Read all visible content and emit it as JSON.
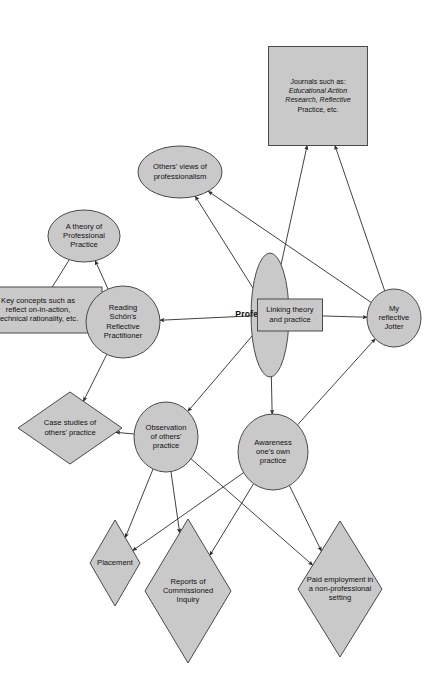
{
  "diagram": {
    "orientation": "rotated-90-clockwise",
    "colors": {
      "shape_fill": "#c9c9c9",
      "shape_stroke": "#4a4a4a",
      "edge": "#2b2b2b",
      "text": "#111111",
      "background": "#ffffff"
    },
    "nodes": [
      {
        "id": "key-concepts",
        "shape": "rectangle",
        "lines": [
          "Key concepts such as",
          "reflect on-in-action,",
          "technical rationality, etc."
        ],
        "style": "plain"
      },
      {
        "id": "theory-professional-practice",
        "shape": "ellipse",
        "lines": [
          "A theory of",
          "Professional",
          "Practice"
        ],
        "style": "plain"
      },
      {
        "id": "reading-schon",
        "shape": "ellipse",
        "lines": [
          "Reading",
          "Schön's",
          "Reflective",
          "Practitioner"
        ],
        "style": "plain"
      },
      {
        "id": "case-studies",
        "shape": "diamond",
        "lines": [
          "Case studies of",
          "others' practice"
        ],
        "style": "plain"
      },
      {
        "id": "others-views",
        "shape": "ellipse",
        "lines": [
          "Others' views of",
          "professionalism"
        ],
        "style": "plain"
      },
      {
        "id": "journals",
        "shape": "diamond",
        "lines": [
          "Journals such as:",
          "Educational Action",
          "Research, Reflective",
          "Practice, etc."
        ],
        "style": "italic-partial"
      },
      {
        "id": "professionalism",
        "shape": "ellipse",
        "lines": [
          "Professionalism"
        ],
        "style": "bold"
      },
      {
        "id": "linking-theory",
        "shape": "rectangle",
        "lines": [
          "Linking theory",
          "and practice"
        ],
        "style": "plain"
      },
      {
        "id": "my-reflective-jotter",
        "shape": "circle",
        "lines": [
          "My",
          "reflective",
          "Jotter"
        ],
        "style": "plain"
      },
      {
        "id": "observation-others",
        "shape": "circle",
        "lines": [
          "Observation",
          "of others'",
          "practice"
        ],
        "style": "plain"
      },
      {
        "id": "awareness-own",
        "shape": "circle",
        "lines": [
          "Awareness",
          "one's own",
          "practice"
        ],
        "style": "plain"
      },
      {
        "id": "placement",
        "shape": "diamond",
        "lines": [
          "Placement"
        ],
        "style": "plain"
      },
      {
        "id": "reports-inquiry",
        "shape": "diamond",
        "lines": [
          "Reports of",
          "Commissioned",
          "Inquiry"
        ],
        "style": "plain"
      },
      {
        "id": "paid-employment",
        "shape": "diamond",
        "lines": [
          "Paid employment in",
          "a non-professional",
          "setting"
        ],
        "style": "plain"
      }
    ],
    "edges": [
      {
        "from": "professionalism",
        "to": "reading-schon",
        "arrow": "to"
      },
      {
        "from": "professionalism",
        "to": "linking-theory",
        "arrow": "none"
      },
      {
        "from": "linking-theory",
        "to": "my-reflective-jotter",
        "arrow": "to"
      },
      {
        "from": "professionalism",
        "to": "others-views",
        "arrow": "to"
      },
      {
        "from": "professionalism",
        "to": "journals",
        "arrow": "to"
      },
      {
        "from": "professionalism",
        "to": "observation-others",
        "arrow": "to"
      },
      {
        "from": "professionalism",
        "to": "awareness-own",
        "arrow": "to"
      },
      {
        "from": "my-reflective-jotter",
        "to": "others-views",
        "arrow": "to"
      },
      {
        "from": "my-reflective-jotter",
        "to": "journals",
        "arrow": "to"
      },
      {
        "from": "awareness-own",
        "to": "my-reflective-jotter",
        "arrow": "to"
      },
      {
        "from": "reading-schon",
        "to": "theory-professional-practice",
        "arrow": "to"
      },
      {
        "from": "reading-schon",
        "to": "case-studies",
        "arrow": "to"
      },
      {
        "from": "key-concepts",
        "to": "theory-professional-practice",
        "arrow": "none"
      },
      {
        "from": "observation-others",
        "to": "case-studies",
        "arrow": "to"
      },
      {
        "from": "observation-others",
        "to": "placement",
        "arrow": "to"
      },
      {
        "from": "observation-others",
        "to": "reports-inquiry",
        "arrow": "to"
      },
      {
        "from": "observation-others",
        "to": "paid-employment",
        "arrow": "to"
      },
      {
        "from": "awareness-own",
        "to": "placement",
        "arrow": "to"
      },
      {
        "from": "awareness-own",
        "to": "reports-inquiry",
        "arrow": "to"
      },
      {
        "from": "awareness-own",
        "to": "paid-employment",
        "arrow": "to"
      }
    ]
  }
}
